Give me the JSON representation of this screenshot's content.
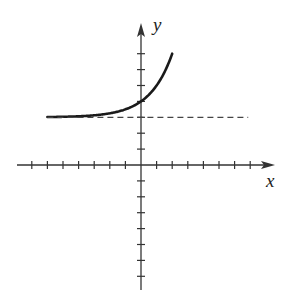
{
  "chart_data": {
    "type": "line",
    "title": "",
    "xlabel": "x",
    "ylabel": "y",
    "xlim": [
      -7,
      7
    ],
    "ylim": [
      -7,
      7
    ],
    "grid": false,
    "tick_step": 1,
    "tick_labels": false,
    "series": [
      {
        "name": "y = 2^x + 3",
        "style": "solid",
        "x": [
          -6,
          -5,
          -4,
          -3,
          -2,
          -1,
          0,
          1,
          2
        ],
        "y": [
          3.02,
          3.03,
          3.06,
          3.13,
          3.25,
          3.5,
          4,
          5,
          7
        ]
      },
      {
        "name": "asymptote y = 3",
        "style": "dashed",
        "x": [
          -6,
          2
        ],
        "y": [
          3,
          3
        ]
      }
    ],
    "colors": {
      "curve": "#1a1a1a",
      "axes": "#333333",
      "asymptote": "#444444"
    }
  },
  "labels": {
    "x_axis": "x",
    "y_axis": "y"
  }
}
